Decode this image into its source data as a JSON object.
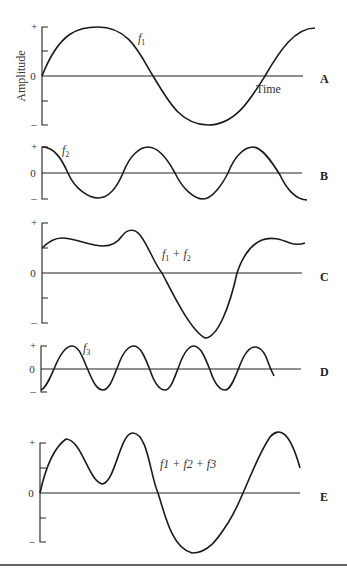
{
  "figure": {
    "y_axis_label": "Amplitude",
    "x_axis_label": "Time",
    "tick_labels": {
      "plus": "+",
      "zero": "0",
      "minus": "–"
    },
    "line_color": "#222222",
    "bottom_rule_color": "#333333"
  },
  "panels": [
    {
      "id": "A",
      "letter": "A",
      "label_main": "f",
      "label_sub": "1",
      "description": "Fundamental sine wave f1, ~1 cycle"
    },
    {
      "id": "B",
      "letter": "B",
      "label_main": "f",
      "label_sub": "2",
      "description": "Second frequency f2, ~2.5 cycles (cosine start)"
    },
    {
      "id": "C",
      "letter": "C",
      "label_main": "f",
      "label_sub": "1",
      "label_rest": " + f",
      "label_sub2": "2",
      "description": "Sum f1 + f2"
    },
    {
      "id": "D",
      "letter": "D",
      "label_main": "f",
      "label_sub": "3",
      "description": "Third frequency f3, ~4 cycles"
    },
    {
      "id": "E",
      "letter": "E",
      "label_text": "f1 + f2 + f3",
      "description": "Sum f1 + f2 + f3"
    }
  ]
}
